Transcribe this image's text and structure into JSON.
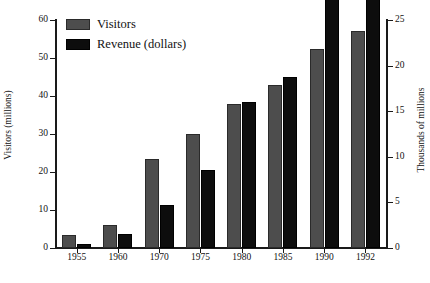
{
  "chart_data": {
    "type": "bar",
    "title": "",
    "subtitle": "",
    "xlabel": "",
    "ylabel": "Visitors (millions)",
    "y2label": "Thousands of millions",
    "categories": [
      "1955",
      "1960",
      "1970",
      "1975",
      "1980",
      "1985",
      "1990",
      "1992"
    ],
    "series": [
      {
        "name": "Visitors",
        "axis": "left",
        "color": "#4d4d4d",
        "values": [
          3.3,
          6.0,
          23.5,
          30.0,
          38.0,
          43.0,
          52.3,
          57.0
        ]
      },
      {
        "name": "Revenue (dollars)",
        "axis": "right",
        "color": "#0d0d0d",
        "values": [
          0.4,
          1.5,
          4.7,
          8.5,
          16.0,
          18.7,
          44.3,
          53.0
        ]
      }
    ],
    "ylim": [
      0,
      60
    ],
    "yticks": [
      0,
      10,
      20,
      30,
      40,
      50,
      60
    ],
    "y2lim": [
      0,
      25
    ],
    "y2ticks": [
      0,
      5,
      10,
      15,
      20,
      25
    ],
    "grid": false,
    "legend_position": "top-left",
    "legend": [
      "Visitors",
      "Revenue (dollars)"
    ]
  },
  "legend": {
    "items": [
      {
        "label": "Visitors",
        "swatch": "visitors-swatch"
      },
      {
        "label": "Revenue (dollars)",
        "swatch": "revenue-swatch"
      }
    ]
  },
  "axes": {
    "left_title": "Visitors (millions)",
    "right_title": "Thousands of millions",
    "left_ticks": [
      "60",
      "50",
      "40",
      "30",
      "20",
      "10",
      "0"
    ],
    "right_ticks": [
      "25",
      "20",
      "15",
      "10",
      "5",
      "0"
    ],
    "x_ticks": [
      "1955",
      "1960",
      "1970",
      "1975",
      "1980",
      "1985",
      "1990",
      "1992"
    ]
  }
}
